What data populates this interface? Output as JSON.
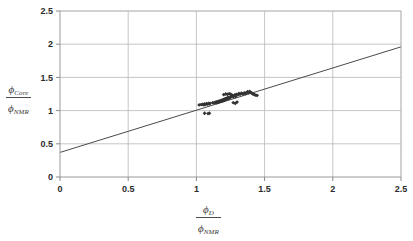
{
  "chart": {
    "type": "scatter",
    "title": "",
    "marker": "diamond",
    "marker_color": "#333333",
    "line_color": "#4a4a4a",
    "grid_color": "#b8b8b8",
    "axis_color": "#999999",
    "background": "#ffffff"
  },
  "yaxis": {
    "label_numerator_symbol": "ϕ",
    "label_numerator_sub": "Core",
    "label_denominator_symbol": "ϕ",
    "label_denominator_sub": "NMR",
    "min": 0,
    "max": 2.5,
    "ticks": [
      "0",
      "0.5",
      "1",
      "1.5",
      "2",
      "2.5"
    ],
    "tick_values": [
      0,
      0.5,
      1,
      1.5,
      2,
      2.5
    ]
  },
  "xaxis": {
    "label_numerator_symbol": "ϕ",
    "label_numerator_sub": "D",
    "label_denominator_symbol": "ϕ",
    "label_denominator_sub": "NMR",
    "min": 0,
    "max": 2.5,
    "ticks": [
      "0",
      "0.5",
      "1",
      "1.5",
      "2",
      "2.5"
    ],
    "tick_values": [
      0,
      0.5,
      1,
      1.5,
      2,
      2.5
    ]
  },
  "chart_data": {
    "type": "scatter",
    "title": "",
    "xlabel": "ϕ_D / ϕ_NMR",
    "ylabel": "ϕ_Core / ϕ_NMR",
    "xlim": [
      0,
      2.5
    ],
    "ylim": [
      0,
      2.5
    ],
    "xticks": [
      0,
      0.5,
      1,
      1.5,
      2,
      2.5
    ],
    "yticks": [
      0,
      0.5,
      1,
      1.5,
      2,
      2.5
    ],
    "grid": true,
    "legend": "none",
    "series": [
      {
        "name": "Core vs Density porosity ratio",
        "marker": "diamond",
        "color": "#333333",
        "points": [
          [
            1.02,
            1.085
          ],
          [
            1.035,
            1.09
          ],
          [
            1.045,
            1.095
          ],
          [
            1.055,
            1.088
          ],
          [
            1.06,
            1.1
          ],
          [
            1.068,
            1.095
          ],
          [
            1.075,
            1.105
          ],
          [
            1.082,
            1.098
          ],
          [
            1.09,
            1.108
          ],
          [
            1.095,
            1.1
          ],
          [
            1.1,
            1.11
          ],
          [
            1.06,
            0.96
          ],
          [
            1.085,
            0.955
          ],
          [
            1.095,
            0.96
          ],
          [
            1.12,
            1.12
          ],
          [
            1.13,
            1.115
          ],
          [
            1.138,
            1.125
          ],
          [
            1.145,
            1.13
          ],
          [
            1.15,
            1.118
          ],
          [
            1.155,
            1.135
          ],
          [
            1.16,
            1.128
          ],
          [
            1.162,
            1.14
          ],
          [
            1.168,
            1.132
          ],
          [
            1.172,
            1.145
          ],
          [
            1.175,
            1.138
          ],
          [
            1.18,
            1.15
          ],
          [
            1.182,
            1.142
          ],
          [
            1.186,
            1.155
          ],
          [
            1.19,
            1.148
          ],
          [
            1.193,
            1.16
          ],
          [
            1.196,
            1.152
          ],
          [
            1.2,
            1.165
          ],
          [
            1.202,
            1.158
          ],
          [
            1.205,
            1.17
          ],
          [
            1.208,
            1.162
          ],
          [
            1.21,
            1.175
          ],
          [
            1.212,
            1.168
          ],
          [
            1.215,
            1.18
          ],
          [
            1.218,
            1.172
          ],
          [
            1.22,
            1.185
          ],
          [
            1.224,
            1.178
          ],
          [
            1.228,
            1.19
          ],
          [
            1.23,
            1.182
          ],
          [
            1.234,
            1.195
          ],
          [
            1.238,
            1.186
          ],
          [
            1.242,
            1.2
          ],
          [
            1.245,
            1.192
          ],
          [
            1.25,
            1.205
          ],
          [
            1.2,
            1.24
          ],
          [
            1.215,
            1.25
          ],
          [
            1.228,
            1.245
          ],
          [
            1.24,
            1.255
          ],
          [
            1.252,
            1.248
          ],
          [
            1.258,
            1.215
          ],
          [
            1.265,
            1.23
          ],
          [
            1.27,
            1.208
          ],
          [
            1.275,
            1.222
          ],
          [
            1.282,
            1.235
          ],
          [
            1.288,
            1.212
          ],
          [
            1.292,
            1.245
          ],
          [
            1.27,
            1.12
          ],
          [
            1.285,
            1.108
          ],
          [
            1.298,
            1.128
          ],
          [
            1.305,
            1.24
          ],
          [
            1.312,
            1.258
          ],
          [
            1.32,
            1.245
          ],
          [
            1.33,
            1.262
          ],
          [
            1.34,
            1.25
          ],
          [
            1.352,
            1.268
          ],
          [
            1.36,
            1.255
          ],
          [
            1.368,
            1.272
          ],
          [
            1.375,
            1.285
          ],
          [
            1.382,
            1.27
          ],
          [
            1.39,
            1.288
          ],
          [
            1.398,
            1.275
          ],
          [
            1.405,
            1.265
          ],
          [
            1.415,
            1.25
          ],
          [
            1.425,
            1.24
          ],
          [
            1.435,
            1.232
          ],
          [
            1.445,
            1.228
          ]
        ]
      }
    ],
    "trendline": {
      "name": "fitted line",
      "x": [
        0,
        2.5
      ],
      "y": [
        0.37,
        1.96
      ],
      "color": "#4a4a4a"
    }
  }
}
